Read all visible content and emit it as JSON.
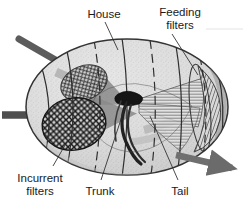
{
  "figure": {
    "background_color": "#ffffff"
  },
  "labels": {
    "house": "House",
    "feeding_filters_line1": "Feeding",
    "feeding_filters_line2": "filters",
    "incurrent_filters_line1": "Incurrent",
    "incurrent_filters_line2": "filters",
    "trunk": "Trunk",
    "tail": "Tail"
  },
  "colors": {
    "label_text": "#1a1a1a",
    "leader_line": "#2a2a2a",
    "house_fill": "#d9d9d9",
    "house_outline": "#3a3a3a",
    "rib_line": "#2e2e2e",
    "flow_arrow": "#808080",
    "incurrent_arrow": "#4a4a4a",
    "mesh_filter": "#222222",
    "trunk_body": "#1c1c1c",
    "tail": "#242424",
    "feeding_filter_striae": "#555555"
  },
  "parts": [
    {
      "name": "house",
      "description": "translucent gelatinous oval house enclosing the animal"
    },
    {
      "name": "incurrent-filters",
      "description": "two cross-hatched mesh screens on the left where water enters"
    },
    {
      "name": "feeding-filters",
      "description": "fan-shaped striated filters on the right"
    },
    {
      "name": "trunk",
      "description": "dark compact body of the larvacean at the center"
    },
    {
      "name": "tail",
      "description": "long curved muscular tail trailing from the trunk"
    },
    {
      "name": "incurrent-flow-arrow",
      "description": "dark arrow entering at left"
    },
    {
      "name": "upper-inflow-arrow",
      "description": "dark arrow entering at upper left"
    },
    {
      "name": "excurrent-flow-arrow",
      "description": "arrow exiting to lower right"
    },
    {
      "name": "internal-flow-arrows",
      "description": "grey arrows showing water path through house"
    }
  ]
}
